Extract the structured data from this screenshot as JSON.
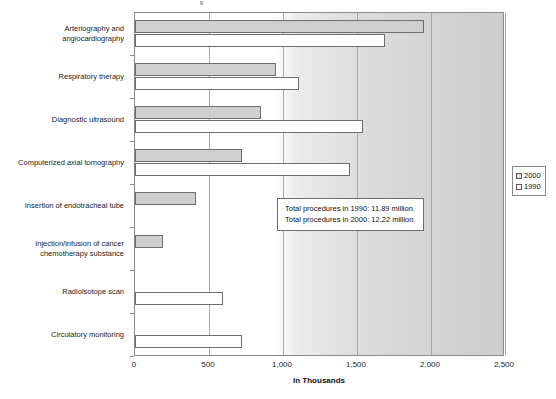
{
  "chart_data": {
    "type": "bar",
    "orientation": "horizontal",
    "title": "",
    "xlabel": "In Thousands",
    "ylabel": "",
    "xlim": [
      0,
      2500
    ],
    "xticks": [
      "0",
      "500",
      "1,000",
      "1,500",
      "2,000",
      "2,500"
    ],
    "xtick_values": [
      0,
      500,
      1000,
      1500,
      2000,
      2500
    ],
    "grid": true,
    "legend_position": "right",
    "categories": [
      "Arteriography and angiocardiography",
      "Respiratory therapy",
      "Diagnostic ultrasound",
      "Computerized axial tomography",
      "Insertion of endotracheal tube",
      "Injection/infusion of cancer chemotherapy substance",
      "Radioisotope scan",
      "Circulatory monitoring"
    ],
    "category_lines": [
      [
        "Arteriography and",
        "angiocardiography"
      ],
      [
        "Respiratory therapy"
      ],
      [
        "Diagnostic ultrasound"
      ],
      [
        "Computerized axial tomography"
      ],
      [
        "Insertion of endotracheal tube"
      ],
      [
        "Injection/infusion of cancer",
        "chemotherapy substance"
      ],
      [
        "Radioisotope scan"
      ],
      [
        "Circulatory monitoring"
      ]
    ],
    "series": [
      {
        "name": "2000",
        "color": "#cfcfcf",
        "values": [
          1950,
          950,
          850,
          725,
          410,
          190,
          0,
          0
        ]
      },
      {
        "name": "1990",
        "color": "#ffffff",
        "values": [
          1690,
          1105,
          1540,
          1450,
          0,
          0,
          595,
          725
        ]
      }
    ],
    "annotations": [
      "Total procedures in 1990: 11.89 million.",
      "Total procedures in 2000: 12.22 million."
    ]
  },
  "legend": {
    "items": [
      {
        "label": "2000"
      },
      {
        "label": "1990"
      }
    ]
  },
  "colors": {
    "series_2000": "#cfcfcf",
    "series_1990": "#ffffff",
    "axis": "#8a8a8a",
    "gridline": "#a9a9a9",
    "text": "#1c1c1c"
  }
}
